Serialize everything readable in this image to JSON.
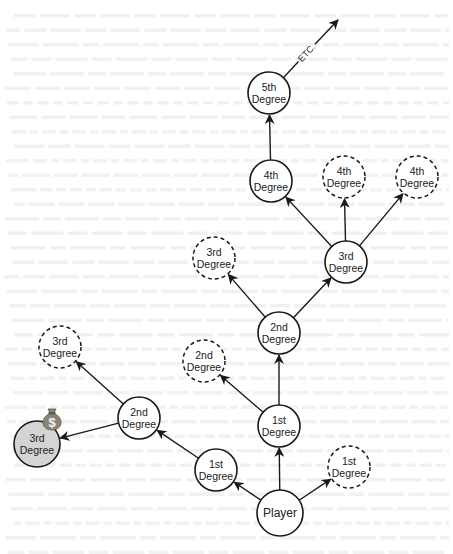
{
  "diagram": {
    "title": "",
    "nodes": [
      {
        "id": "player",
        "line1": "Player",
        "line2": "",
        "cx": 280,
        "cy": 513,
        "r": 23,
        "style": "solid"
      },
      {
        "id": "first-upper",
        "line1": "1st",
        "line2": "Degree",
        "cx": 279,
        "cy": 426,
        "r": 21,
        "style": "solid"
      },
      {
        "id": "first-left",
        "line1": "1st",
        "line2": "Degree",
        "cx": 216,
        "cy": 470,
        "r": 21,
        "style": "solid"
      },
      {
        "id": "first-right",
        "line1": "1st",
        "line2": "Degree",
        "cx": 349,
        "cy": 467,
        "r": 21,
        "style": "dashed"
      },
      {
        "id": "second-top",
        "line1": "2nd",
        "line2": "Degree",
        "cx": 279,
        "cy": 333,
        "r": 21,
        "style": "solid"
      },
      {
        "id": "second-dashed",
        "line1": "2nd",
        "line2": "Degree",
        "cx": 204,
        "cy": 361,
        "r": 21,
        "style": "dashed"
      },
      {
        "id": "second-left",
        "line1": "2nd",
        "line2": "Degree",
        "cx": 139,
        "cy": 418,
        "r": 21,
        "style": "solid"
      },
      {
        "id": "third-gray",
        "line1": "3rd",
        "line2": "Degree",
        "cx": 37,
        "cy": 444,
        "r": 23,
        "style": "filled"
      },
      {
        "id": "third-dashed-left",
        "line1": "3rd",
        "line2": "Degree",
        "cx": 60,
        "cy": 347,
        "r": 21,
        "style": "dashed"
      },
      {
        "id": "third-dashed-mid",
        "line1": "3rd",
        "line2": "Degree",
        "cx": 214,
        "cy": 258,
        "r": 21,
        "style": "dashed"
      },
      {
        "id": "third-solid",
        "line1": "3rd",
        "line2": "Degree",
        "cx": 346,
        "cy": 262,
        "r": 21,
        "style": "solid"
      },
      {
        "id": "fourth-solid",
        "line1": "4th",
        "line2": "Degree",
        "cx": 271,
        "cy": 181,
        "r": 21,
        "style": "solid"
      },
      {
        "id": "fourth-dashed-mid",
        "line1": "4th",
        "line2": "Degree",
        "cx": 344,
        "cy": 177,
        "r": 21,
        "style": "dashed"
      },
      {
        "id": "fourth-dashed-right",
        "line1": "4th",
        "line2": "Degree",
        "cx": 417,
        "cy": 177,
        "r": 21,
        "style": "dashed"
      },
      {
        "id": "fifth",
        "line1": "5th",
        "line2": "Degree",
        "cx": 269,
        "cy": 93,
        "r": 21,
        "style": "solid"
      }
    ],
    "edges": [
      {
        "from": "player",
        "to": "first-upper"
      },
      {
        "from": "player",
        "to": "first-left"
      },
      {
        "from": "player",
        "to": "first-right"
      },
      {
        "from": "first-upper",
        "to": "second-top"
      },
      {
        "from": "first-upper",
        "to": "second-dashed"
      },
      {
        "from": "first-left",
        "to": "second-left"
      },
      {
        "from": "second-left",
        "to": "third-gray"
      },
      {
        "from": "second-left",
        "to": "third-dashed-left"
      },
      {
        "from": "second-top",
        "to": "third-dashed-mid"
      },
      {
        "from": "second-top",
        "to": "third-solid"
      },
      {
        "from": "third-solid",
        "to": "fourth-solid"
      },
      {
        "from": "third-solid",
        "to": "fourth-dashed-mid"
      },
      {
        "from": "third-solid",
        "to": "fourth-dashed-right"
      },
      {
        "from": "fourth-solid",
        "to": "fifth"
      }
    ],
    "continuation": {
      "from": "fifth",
      "label": "ETC.",
      "x2": 338,
      "y2": 20
    },
    "reward_icon": {
      "icon": "money-bag-icon",
      "glyph": "$",
      "attached_to": "third-gray",
      "cx": 52,
      "cy": 421
    },
    "colors": {
      "stroke": "#1a1a1a",
      "text": "#222222",
      "node_fill": "#ffffff",
      "highlight_fill": "#d4d4d4",
      "bag_fill": "#8a8478",
      "bag_glyph": "#f2f2f2",
      "bleed_text": "#e6e6e6"
    }
  }
}
